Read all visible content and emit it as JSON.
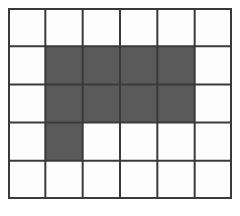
{
  "figure": {
    "kind": "shaded-grid",
    "columns": 6,
    "rows": 5,
    "cell_count": 30,
    "shaded_cell_count": 9,
    "unshaded_cell_count": 21,
    "origin_x": 8,
    "origin_y": 8,
    "grid_width": 224,
    "grid_height": 191,
    "cell_width": 37.33,
    "cell_height": 38.2,
    "line_width": 2,
    "outer_border_width": 2
  },
  "colors": {
    "page_background": "#ffffff",
    "cell_fill_empty": "#fdfdfd",
    "cell_fill_shaded": "#5a5a5a",
    "grid_line": "#3a3a3a",
    "outer_border": "#3a3a3a"
  },
  "chart_data": {
    "type": "heatmap",
    "title": "",
    "subtitle": "",
    "xlabel": "",
    "ylabel": "",
    "grid": true,
    "legend_position": "none",
    "columns": 6,
    "rows": 5,
    "x": [
      1,
      2,
      3,
      4,
      5,
      6
    ],
    "y": [
      1,
      2,
      3,
      4,
      5
    ],
    "xlim": [
      0,
      6
    ],
    "ylim": [
      0,
      5
    ],
    "value_legend": {
      "0": "unshaded (white)",
      "1": "shaded (dark gray)"
    },
    "cells": [
      [
        0,
        0,
        0,
        0,
        0,
        0
      ],
      [
        0,
        1,
        1,
        1,
        1,
        0
      ],
      [
        0,
        1,
        1,
        1,
        1,
        0
      ],
      [
        0,
        1,
        0,
        0,
        0,
        0
      ],
      [
        0,
        0,
        0,
        0,
        0,
        0
      ]
    ],
    "shaded_coordinates": [
      {
        "row": 2,
        "col": 2
      },
      {
        "row": 2,
        "col": 3
      },
      {
        "row": 2,
        "col": 4
      },
      {
        "row": 2,
        "col": 5
      },
      {
        "row": 3,
        "col": 2
      },
      {
        "row": 3,
        "col": 3
      },
      {
        "row": 3,
        "col": 4
      },
      {
        "row": 3,
        "col": 5
      },
      {
        "row": 4,
        "col": 2
      }
    ],
    "shaded_per_row": [
      0,
      4,
      4,
      1,
      0
    ],
    "shaded_per_column": [
      0,
      3,
      2,
      2,
      2,
      0
    ]
  }
}
